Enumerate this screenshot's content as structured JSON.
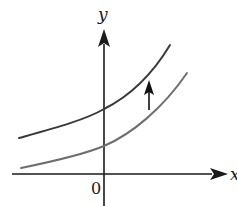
{
  "diagram": {
    "axes": {
      "x_label": "x",
      "y_label": "y",
      "origin_label": "0"
    },
    "curves": [
      {
        "name": "upper-curve",
        "color": "#3a3a3a",
        "path": "M19,138 C55,128 85,120 104,109 C130,96 152,75 170,45"
      },
      {
        "name": "lower-curve",
        "color": "#6e6e6e",
        "path": "M21,168 C55,161 85,154 104,146 C132,134 163,108 187,73"
      }
    ],
    "shift_arrow": {
      "direction": "up",
      "color": "#111111"
    },
    "colors": {
      "axis": "#1a1a1a",
      "background": "#ffffff"
    }
  }
}
